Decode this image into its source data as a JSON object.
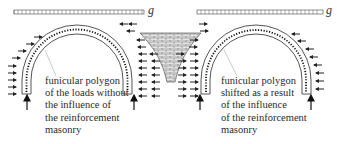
{
  "diagram": {
    "loads": [
      {
        "label": "g"
      },
      {
        "label": "g"
      }
    ],
    "left_arch": {
      "label_lines": [
        "funicular polygon",
        "of  the loads without",
        "the influence of",
        "the reinforcement",
        "masonry"
      ]
    },
    "right_arch": {
      "label_lines": [
        "funicular polygon",
        "shifted as a result",
        "of  the influence",
        "of the reinforcement",
        "masonry"
      ]
    },
    "colors": {
      "line": "#2b2b2b",
      "masonry_fill": "#e4e4e4",
      "leader": "#9a9a9a"
    }
  }
}
